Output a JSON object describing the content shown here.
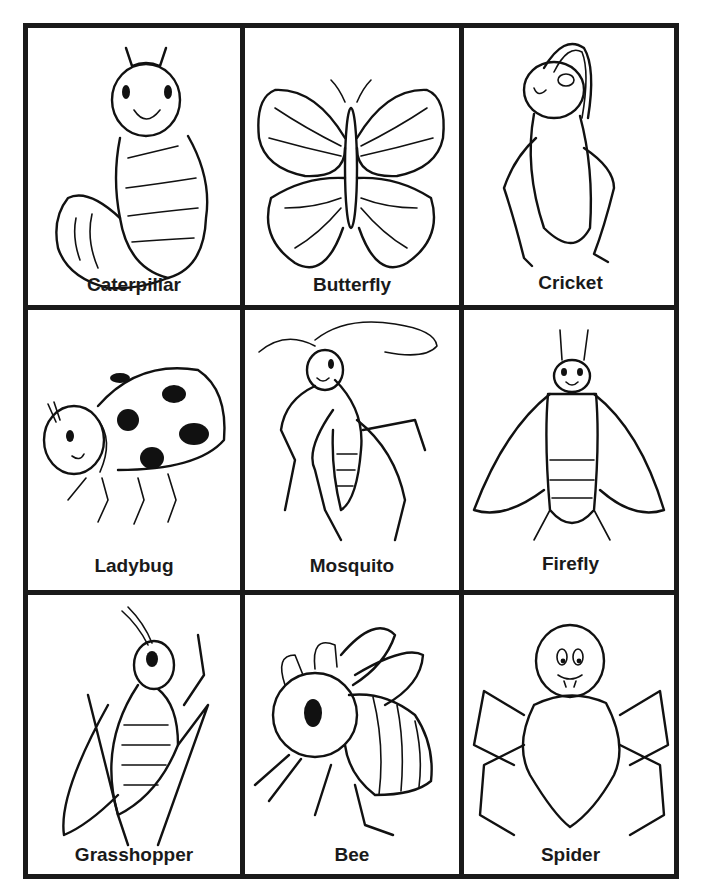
{
  "document": {
    "type": "insect picture cards",
    "grid": {
      "rows": 3,
      "columns": 3
    },
    "border_color": "#1a1a1a",
    "background": "#ffffff"
  },
  "cards": [
    {
      "label": "Caterpillar",
      "icon": "caterpillar-icon"
    },
    {
      "label": "Butterfly",
      "icon": "butterfly-icon"
    },
    {
      "label": "Cricket",
      "icon": "cricket-icon"
    },
    {
      "label": "Ladybug",
      "icon": "ladybug-icon"
    },
    {
      "label": "Mosquito",
      "icon": "mosquito-icon"
    },
    {
      "label": "Firefly",
      "icon": "firefly-icon"
    },
    {
      "label": "Grasshopper",
      "icon": "grasshopper-icon"
    },
    {
      "label": "Bee",
      "icon": "bee-icon"
    },
    {
      "label": "Spider",
      "icon": "spider-icon"
    }
  ]
}
